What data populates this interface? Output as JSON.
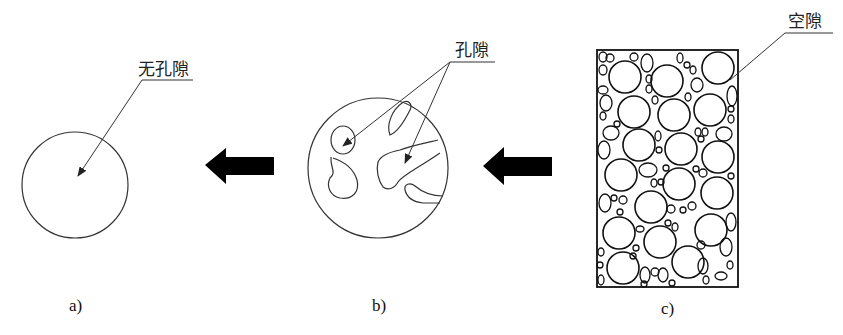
{
  "panels": [
    {
      "id": "a",
      "caption": "a)",
      "label": "无孔隙",
      "description": "solid particle, no pores"
    },
    {
      "id": "b",
      "caption": "b)",
      "label": "孔隙",
      "description": "particle with internal pores"
    },
    {
      "id": "c",
      "caption": "c)",
      "label": "空隙",
      "description": "packed aggregate with voids between particles"
    }
  ],
  "arrows": [
    {
      "from": "b",
      "to": "a",
      "direction": "left"
    },
    {
      "from": "c",
      "to": "b",
      "direction": "left"
    }
  ],
  "colors": {
    "line": "#222222",
    "arrow": "#000000",
    "background": "#ffffff"
  }
}
